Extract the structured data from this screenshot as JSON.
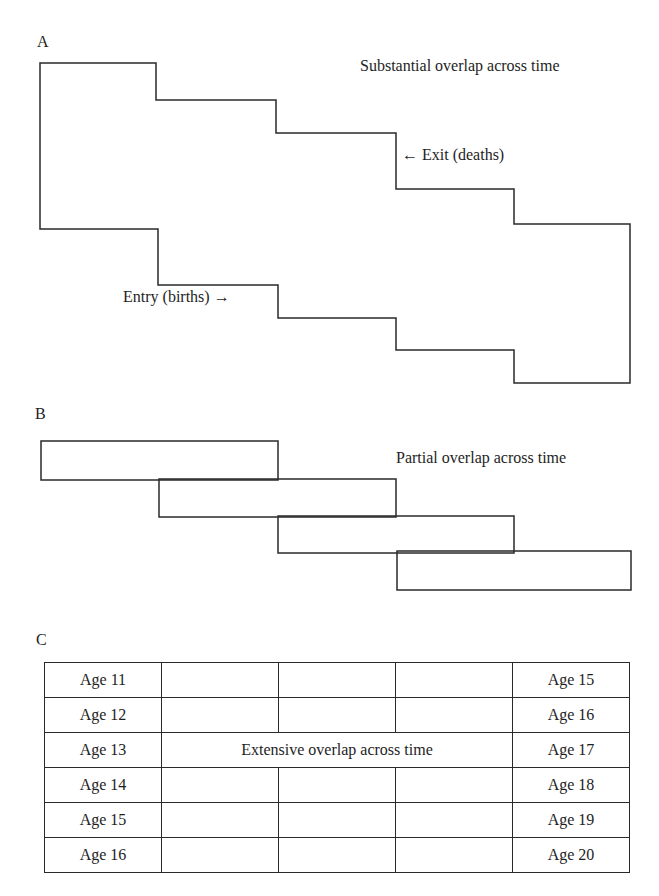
{
  "panels": {
    "A": {
      "letter": "A",
      "title": "Substantial overlap across time",
      "exit_label": "← Exit (deaths)",
      "entry_label": "Entry (births) →"
    },
    "B": {
      "letter": "B",
      "title": "Partial overlap across time"
    },
    "C": {
      "letter": "C",
      "title": "Extensive overlap across time",
      "left_ages": [
        "Age 11",
        "Age 12",
        "Age 13",
        "Age 14",
        "Age 15",
        "Age 16"
      ],
      "right_ages": [
        "Age 15",
        "Age 16",
        "Age 17",
        "Age 18",
        "Age 19",
        "Age 20"
      ]
    }
  },
  "colors": {
    "line": "#2a2a2a",
    "text": "#1e1e1e",
    "background": "#ffffff"
  }
}
